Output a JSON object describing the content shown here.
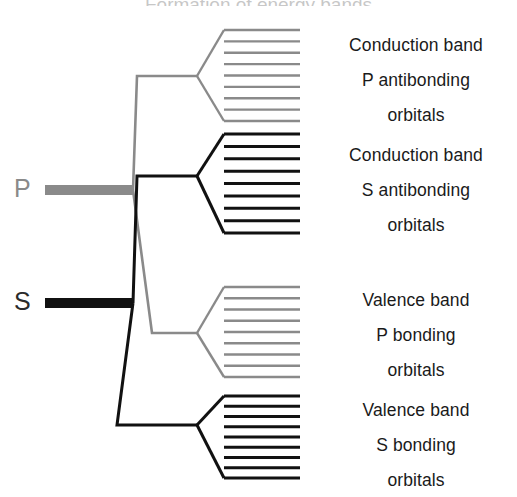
{
  "figure": {
    "title_cropped": "Formation of energy bands",
    "width": 517,
    "height": 497,
    "background": "#ffffff"
  },
  "colors": {
    "p_level": "#8a8a8a",
    "s_level": "#111111",
    "text": "#1a1a1a"
  },
  "atomic_levels": [
    {
      "id": "p",
      "label": "P",
      "color": "#8a8a8a",
      "y": 190
    },
    {
      "id": "s",
      "label": "S",
      "color": "#111111",
      "y": 303
    }
  ],
  "bands": [
    {
      "id": "conduction-p-antibonding",
      "lines": [
        "Conduction band",
        "P antibonding",
        "orbitals"
      ],
      "color": "#8a8a8a",
      "level_count": 9,
      "top": 30,
      "bottom": 121,
      "label_top": 28
    },
    {
      "id": "conduction-s-antibonding",
      "lines": [
        "Conduction band",
        "S antibonding",
        "orbitals"
      ],
      "color": "#111111",
      "level_count": 9,
      "top": 134,
      "bottom": 233,
      "label_top": 138
    },
    {
      "id": "valence-p-bonding",
      "lines": [
        "Valence band",
        "P bonding",
        "orbitals"
      ],
      "color": "#8a8a8a",
      "level_count": 9,
      "top": 287,
      "bottom": 377,
      "label_top": 283
    },
    {
      "id": "valence-s-bonding",
      "lines": [
        "Valence band",
        "S bonding",
        "orbitals"
      ],
      "color": "#111111",
      "level_count": 9,
      "top": 396,
      "bottom": 478,
      "label_top": 393
    }
  ],
  "chart_data": {
    "type": "diagram",
    "title": "Formation of energy bands",
    "categories": [
      "Conduction band P antibonding orbitals",
      "Conduction band S antibonding orbitals",
      "Valence band P bonding orbitals",
      "Valence band S bonding orbitals"
    ],
    "values": [
      9,
      9,
      9,
      9
    ],
    "xlabel": "",
    "ylabel": "Energy"
  }
}
